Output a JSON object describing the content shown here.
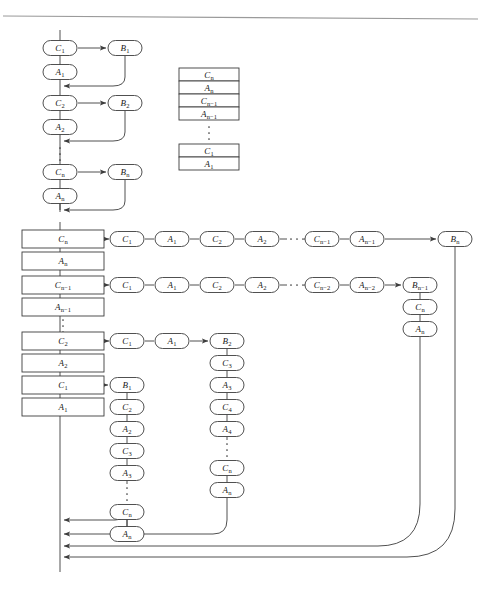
{
  "page": {
    "background": "#ffffff",
    "stroke": "#3c3c3c",
    "text_color": "#1a1a1a",
    "rule_color": "#9a9a9a"
  },
  "figures": {
    "top_left": {
      "name": "sequential-chain",
      "nodes": [
        {
          "id": "tl-c1",
          "label": "C",
          "sub": "1",
          "x": 60,
          "y": 48,
          "shape": "rounded"
        },
        {
          "id": "tl-b1",
          "label": "B",
          "sub": "1",
          "x": 125,
          "y": 48,
          "shape": "rounded"
        },
        {
          "id": "tl-a1",
          "label": "A",
          "sub": "1",
          "x": 60,
          "y": 72,
          "shape": "rounded"
        },
        {
          "id": "tl-c2",
          "label": "C",
          "sub": "2",
          "x": 60,
          "y": 103,
          "shape": "rounded"
        },
        {
          "id": "tl-b2",
          "label": "B",
          "sub": "2",
          "x": 125,
          "y": 103,
          "shape": "rounded"
        },
        {
          "id": "tl-a2",
          "label": "A",
          "sub": "2",
          "x": 60,
          "y": 127,
          "shape": "rounded"
        },
        {
          "id": "tl-cn",
          "label": "C",
          "sub": "n",
          "x": 60,
          "y": 172,
          "shape": "rounded"
        },
        {
          "id": "tl-bn",
          "label": "B",
          "sub": "n",
          "x": 125,
          "y": 172,
          "shape": "rounded"
        },
        {
          "id": "tl-an",
          "label": "A",
          "sub": "n",
          "x": 60,
          "y": 196,
          "shape": "rounded"
        }
      ],
      "vertical_dots_y": [
        148,
        154,
        160
      ]
    },
    "middle_stack": {
      "name": "memory-stack",
      "x": 179,
      "width": 60,
      "row_height": 13,
      "top": 68,
      "rows_upper": [
        {
          "label": "C",
          "sub": "n"
        },
        {
          "label": "A",
          "sub": "n"
        },
        {
          "label": "C",
          "sub": "n−1"
        },
        {
          "label": "A",
          "sub": "n−1"
        }
      ],
      "rows_lower": [
        {
          "label": "C",
          "sub": "1"
        },
        {
          "label": "A",
          "sub": "1"
        }
      ],
      "vertical_dots_y": [
        127,
        133,
        139
      ]
    },
    "bottom": {
      "name": "expanded-chain",
      "left_stack": {
        "x": 22,
        "width": 82,
        "box_height": 18,
        "rows": [
          {
            "label": "C",
            "sub": "n",
            "y": 239
          },
          {
            "label": "A",
            "sub": "n",
            "y": 261
          },
          {
            "label": "C",
            "sub": "n−1",
            "y": 285
          },
          {
            "label": "A",
            "sub": "n−1",
            "y": 307
          },
          {
            "label": "C",
            "sub": "2",
            "y": 341
          },
          {
            "label": "A",
            "sub": "2",
            "y": 363
          },
          {
            "label": "C",
            "sub": "1",
            "y": 385
          },
          {
            "label": "A",
            "sub": "1",
            "y": 407
          }
        ],
        "vertical_dots_y": [
          320,
          326,
          332
        ]
      },
      "row_1": {
        "y": 239,
        "nodes": [
          {
            "label": "C",
            "sub": "1",
            "x": 127
          },
          {
            "label": "A",
            "sub": "1",
            "x": 172
          },
          {
            "label": "C",
            "sub": "2",
            "x": 217
          },
          {
            "label": "A",
            "sub": "2",
            "x": 262
          },
          {
            "label": "C",
            "sub": "n−1",
            "x": 322
          },
          {
            "label": "A",
            "sub": "n−1",
            "x": 367
          }
        ],
        "dots_x": [
          291,
          297,
          303
        ],
        "target": {
          "label": "B",
          "sub": "n",
          "x": 455
        }
      },
      "row_2": {
        "y": 285,
        "nodes": [
          {
            "label": "C",
            "sub": "1",
            "x": 127
          },
          {
            "label": "A",
            "sub": "1",
            "x": 172
          },
          {
            "label": "C",
            "sub": "2",
            "x": 217
          },
          {
            "label": "A",
            "sub": "2",
            "x": 262
          },
          {
            "label": "C",
            "sub": "n−2",
            "x": 322
          },
          {
            "label": "A",
            "sub": "n−2",
            "x": 367
          }
        ],
        "dots_x": [
          291,
          297,
          303
        ],
        "target": {
          "label": "B",
          "sub": "n−1",
          "x": 420
        },
        "tail": [
          {
            "label": "C",
            "sub": "n",
            "y": 307
          },
          {
            "label": "A",
            "sub": "n",
            "y": 329
          }
        ]
      },
      "row_3": {
        "y": 341,
        "nodes": [
          {
            "label": "C",
            "sub": "1",
            "x": 127
          },
          {
            "label": "A",
            "sub": "1",
            "x": 172
          }
        ],
        "target": {
          "label": "B",
          "sub": "2",
          "x": 227
        },
        "column": [
          {
            "label": "C",
            "sub": "3",
            "y": 363
          },
          {
            "label": "A",
            "sub": "3",
            "y": 385
          },
          {
            "label": "C",
            "sub": "4",
            "y": 407
          },
          {
            "label": "A",
            "sub": "4",
            "y": 429
          },
          {
            "label": "C",
            "sub": "n",
            "y": 468
          },
          {
            "label": "A",
            "sub": "n",
            "y": 490
          }
        ],
        "vertical_dots_y": [
          444,
          450,
          456
        ]
      },
      "row_4": {
        "y": 385,
        "target": {
          "label": "B",
          "sub": "1",
          "x": 127
        },
        "column": [
          {
            "label": "C",
            "sub": "2",
            "y": 407
          },
          {
            "label": "A",
            "sub": "2",
            "y": 429
          },
          {
            "label": "C",
            "sub": "3",
            "y": 451
          },
          {
            "label": "A",
            "sub": "3",
            "y": 473
          },
          {
            "label": "C",
            "sub": "n",
            "y": 512
          },
          {
            "label": "A",
            "sub": "n",
            "y": 534
          }
        ],
        "vertical_dots_y": [
          488,
          494,
          500
        ]
      },
      "return_arrows_y": [
        520,
        534,
        546,
        557
      ],
      "spine_x": 60,
      "spine_top": 222,
      "spine_bottom": 572
    }
  },
  "header_rule": {
    "name": "header-rule",
    "x1": 3,
    "y1": 16,
    "x2": 478,
    "y2": 19
  }
}
